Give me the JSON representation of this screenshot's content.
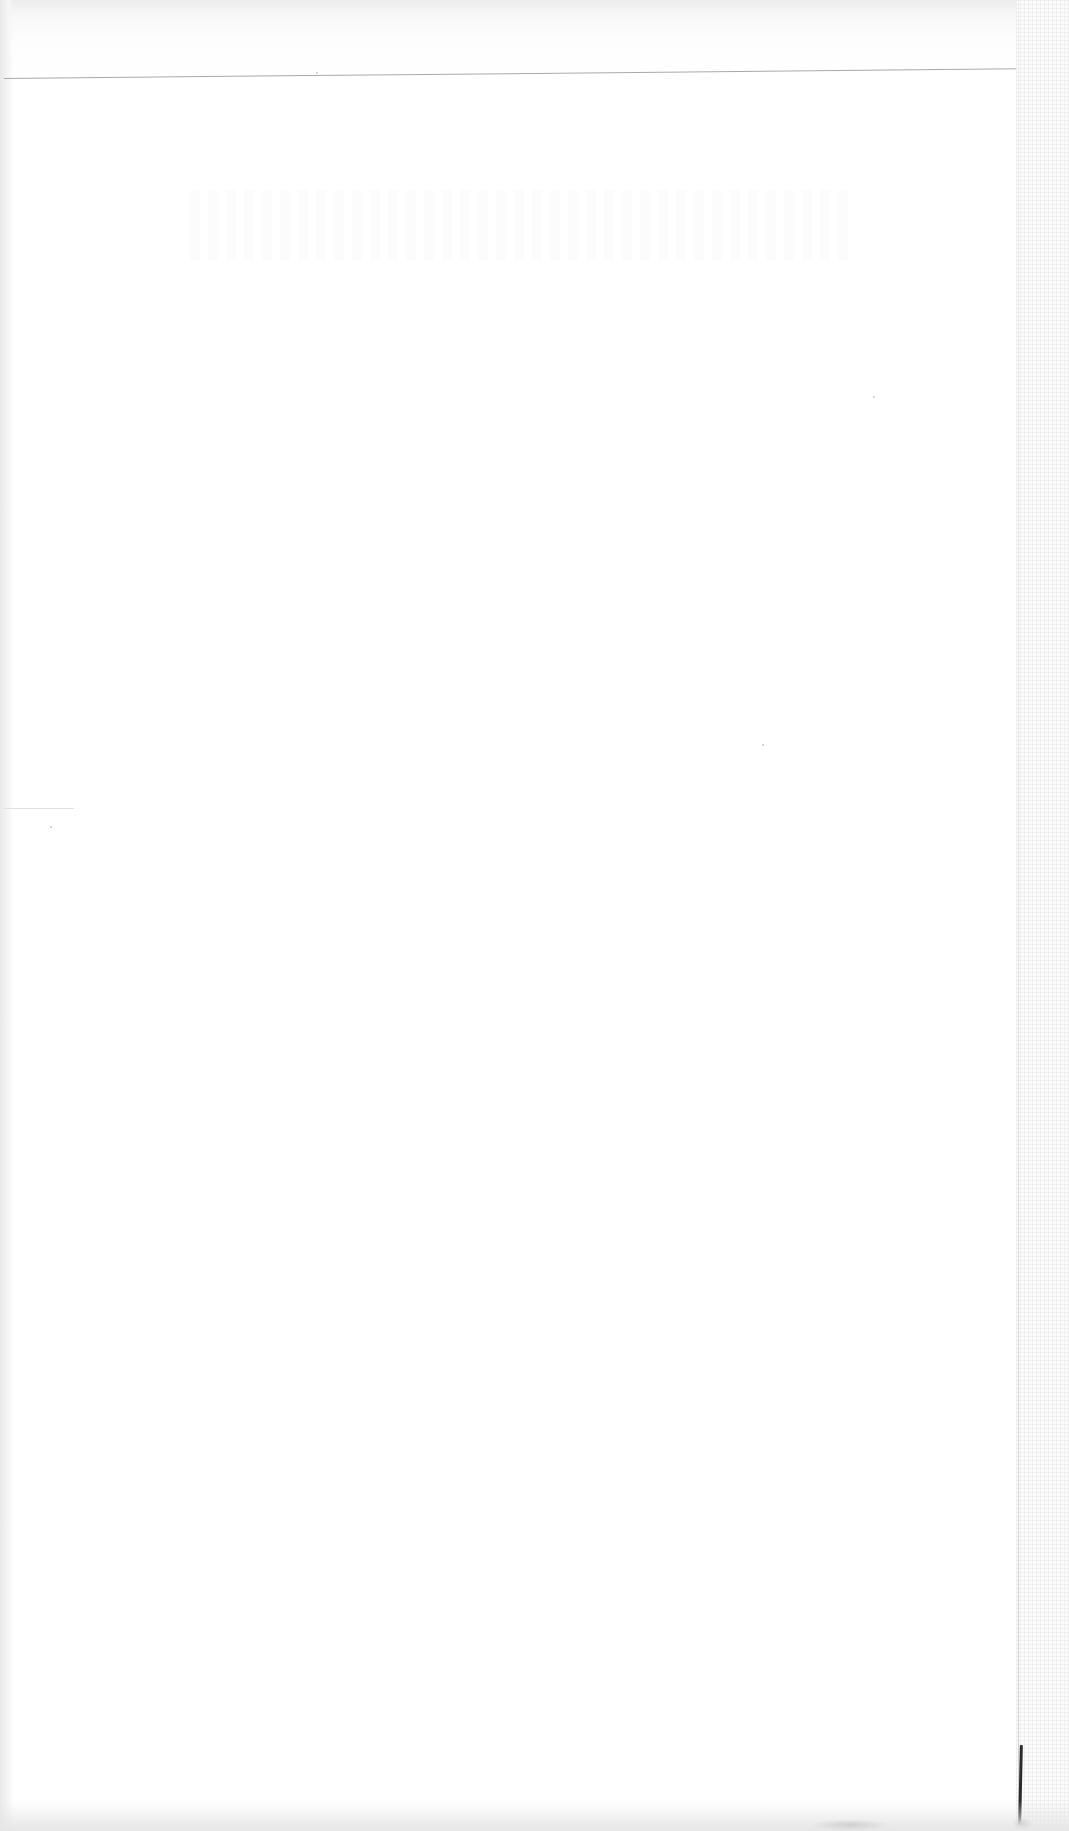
{
  "document": {
    "type": "scanned-page",
    "content": "blank",
    "visible_text": []
  },
  "colors": {
    "paper": "#ffffff",
    "rule": "#a9a9a9",
    "edge_mark": "#2b2b2b"
  }
}
